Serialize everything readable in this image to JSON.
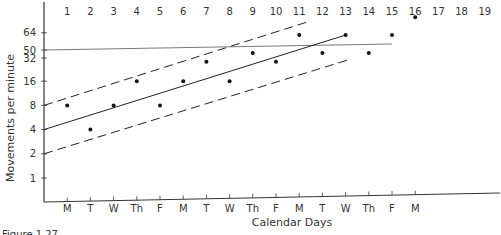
{
  "chart_data": {
    "type": "scatter",
    "title": "",
    "xlabel": "Calendar Days",
    "ylabel": "Movements per minute",
    "y_scale": "log2",
    "y_ticks": [
      1,
      2,
      4,
      8,
      16,
      32,
      50,
      64
    ],
    "y_tick_labels": [
      "1",
      "2",
      "4",
      "8",
      "16",
      "32",
      "50",
      "64"
    ],
    "top_day_numbers": [
      "1",
      "2",
      "3",
      "4",
      "5",
      "6",
      "7",
      "8",
      "9",
      "10",
      "11",
      "12",
      "13",
      "14",
      "15",
      "16",
      "17",
      "18",
      "19"
    ],
    "x_weekday_labels": [
      "M",
      "T",
      "W",
      "Th",
      "F",
      "M",
      "T",
      "W",
      "Th",
      "F",
      "M",
      "T",
      "W",
      "Th",
      "F",
      "M"
    ],
    "grid": false,
    "legend": null,
    "series": [
      {
        "name": "Daily rate",
        "kind": "points",
        "x": [
          1,
          2,
          3,
          4,
          5,
          6,
          7,
          8,
          9,
          10,
          11,
          12,
          13,
          14,
          15,
          16
        ],
        "values": [
          8,
          4,
          8,
          16,
          8,
          16,
          28,
          16,
          36,
          28,
          60,
          36,
          60,
          36,
          60,
          100
        ]
      },
      {
        "name": "Aim line",
        "kind": "line",
        "style": "solid-thin",
        "x": [
          0,
          15
        ],
        "values": [
          50,
          58
        ]
      },
      {
        "name": "Trend line",
        "kind": "line",
        "style": "solid",
        "x": [
          0,
          13
        ],
        "values": [
          4,
          60
        ]
      },
      {
        "name": "Upper bound",
        "kind": "line",
        "style": "dashed",
        "x": [
          0,
          11.5
        ],
        "values": [
          8,
          90
        ]
      },
      {
        "name": "Lower bound",
        "kind": "line",
        "style": "dashed",
        "x": [
          0,
          13.2
        ],
        "values": [
          2,
          30
        ]
      }
    ]
  },
  "caption": "Figure 1.27"
}
